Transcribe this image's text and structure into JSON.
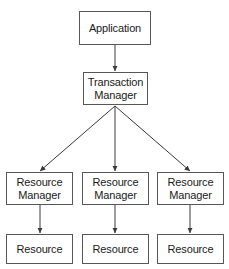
{
  "diagram": {
    "type": "hierarchy-flow",
    "colors": {
      "background": "#ffffff",
      "box_fill": "#ffffff",
      "box_border": "#57575a",
      "edge": "#3a3a3a",
      "text": "#1a1a1a"
    },
    "nodes": [
      {
        "id": "application",
        "label": "Application",
        "line1": "Application",
        "line2": "",
        "x": 79,
        "y": 11,
        "w": 72,
        "h": 34
      },
      {
        "id": "transaction-manager",
        "label": "Transaction Manager",
        "line1": "Transaction",
        "line2": "Manager",
        "x": 83,
        "y": 72,
        "w": 65,
        "h": 33
      },
      {
        "id": "resource-manager-1",
        "label": "Resource Manager",
        "line1": "Resource",
        "line2": "Manager",
        "x": 6,
        "y": 172,
        "w": 67,
        "h": 33
      },
      {
        "id": "resource-manager-2",
        "label": "Resource Manager",
        "line1": "Resource",
        "line2": "Manager",
        "x": 82,
        "y": 172,
        "w": 67,
        "h": 33
      },
      {
        "id": "resource-manager-3",
        "label": "Resource Manager",
        "line1": "Resource",
        "line2": "Manager",
        "x": 157,
        "y": 172,
        "w": 67,
        "h": 33
      },
      {
        "id": "resource-1",
        "label": "Resource",
        "line1": "Resource",
        "line2": "",
        "x": 6,
        "y": 234,
        "w": 67,
        "h": 30
      },
      {
        "id": "resource-2",
        "label": "Resource",
        "line1": "Resource",
        "line2": "",
        "x": 82,
        "y": 234,
        "w": 67,
        "h": 30
      },
      {
        "id": "resource-3",
        "label": "Resource",
        "line1": "Resource",
        "line2": "",
        "x": 157,
        "y": 234,
        "w": 67,
        "h": 30
      }
    ],
    "edges": [
      {
        "id": "application-to-transaction-manager",
        "from": "application",
        "to": "transaction-manager",
        "x1": 115,
        "y1": 45,
        "x2": 115,
        "y2": 71
      },
      {
        "id": "transaction-manager-to-resource-manager-1",
        "from": "transaction-manager",
        "to": "resource-manager-1",
        "x1": 115,
        "y1": 106,
        "x2": 40,
        "y2": 171
      },
      {
        "id": "transaction-manager-to-resource-manager-2",
        "from": "transaction-manager",
        "to": "resource-manager-2",
        "x1": 115,
        "y1": 106,
        "x2": 115,
        "y2": 171
      },
      {
        "id": "transaction-manager-to-resource-manager-3",
        "from": "transaction-manager",
        "to": "resource-manager-3",
        "x1": 115,
        "y1": 106,
        "x2": 190,
        "y2": 171
      },
      {
        "id": "resource-manager-1-to-resource-1",
        "from": "resource-manager-1",
        "to": "resource-1",
        "x1": 40,
        "y1": 205,
        "x2": 40,
        "y2": 233
      },
      {
        "id": "resource-manager-2-to-resource-2",
        "from": "resource-manager-2",
        "to": "resource-2",
        "x1": 115,
        "y1": 205,
        "x2": 115,
        "y2": 233
      },
      {
        "id": "resource-manager-3-to-resource-3",
        "from": "resource-manager-3",
        "to": "resource-3",
        "x1": 190,
        "y1": 205,
        "x2": 190,
        "y2": 233
      }
    ]
  }
}
